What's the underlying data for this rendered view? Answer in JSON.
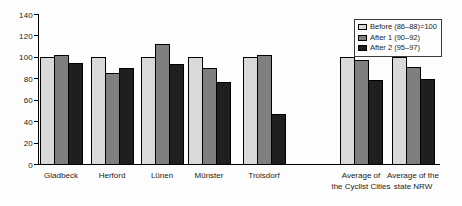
{
  "canvas": {
    "background": "#fdfdfd",
    "axis_color": "#000000",
    "text_color": "#1a1a1a"
  },
  "chart_data": {
    "type": "bar",
    "categories": [
      "Gladbeck",
      "Herford",
      "Lünen",
      "Münster",
      "Troisdorf",
      "Average of\nthe Cyclist Cities",
      "Average of the\nstate NRW"
    ],
    "series": [
      {
        "name": "Before (86–88)=100",
        "color": "#d9d9d9",
        "values": [
          100,
          100,
          100,
          100,
          100,
          100,
          100
        ]
      },
      {
        "name": "After 1 (90–92)",
        "color": "#7f7f7f",
        "values": [
          102,
          85,
          112,
          90,
          102,
          97,
          91
        ]
      },
      {
        "name": "After 2 (95–97)",
        "color": "#1f1f1f",
        "values": [
          94,
          90,
          93,
          77,
          47,
          78,
          79
        ]
      }
    ],
    "xlabel": "",
    "ylabel": "",
    "yticks": [
      0,
      20,
      40,
      60,
      80,
      100,
      120,
      140
    ],
    "ylim": [
      0,
      140
    ],
    "grid": false,
    "legend_position": "top-right",
    "bar_border_color": "#000000",
    "group_separator_after_category": "Troisdorf"
  }
}
